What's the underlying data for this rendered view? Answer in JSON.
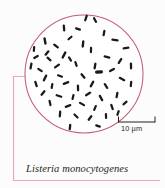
{
  "figure": {
    "title": "Listeria monocytogenes",
    "organism_label": "Listeria monocytogenes",
    "field_shape": "circle",
    "background_color": "#fdfcfc",
    "circle_stroke_color": "#c45b74",
    "bracket_color": "#e8a8b6",
    "cell_color": "#1a1a1a",
    "scale_bar": {
      "label": "10 µm",
      "value": 10,
      "unit": "µm"
    }
  },
  "chart_data": {
    "type": "scatter",
    "title": "Listeria monocytogenes",
    "xlabel": "",
    "ylabel": "",
    "annotations": [
      "10 µm"
    ],
    "field_circle": {
      "cx": 84,
      "cy": 74,
      "r": 59
    },
    "scale_bar_px": {
      "x1": 118,
      "x2": 155,
      "y": 122,
      "length_um": 10
    },
    "cell_count": 58,
    "cell_shape": "rod (bacillus)",
    "cells": [
      {
        "x": 86,
        "y": 18,
        "a": 108,
        "l": 7.0,
        "w": 2.3
      },
      {
        "x": 95,
        "y": 20,
        "a": 62,
        "l": 6.4,
        "w": 2.3
      },
      {
        "x": 64,
        "y": 28,
        "a": 85,
        "l": 7.2,
        "w": 2.3
      },
      {
        "x": 78,
        "y": 29,
        "a": 18,
        "l": 6.2,
        "w": 2.2
      },
      {
        "x": 45,
        "y": 41,
        "a": 80,
        "l": 7.6,
        "w": 2.4
      },
      {
        "x": 70,
        "y": 38,
        "a": 140,
        "l": 6.0,
        "w": 2.2
      },
      {
        "x": 104,
        "y": 33,
        "a": 100,
        "l": 6.6,
        "w": 2.3
      },
      {
        "x": 115,
        "y": 40,
        "a": 8,
        "l": 7.4,
        "w": 2.3
      },
      {
        "x": 34,
        "y": 49,
        "a": 95,
        "l": 6.0,
        "w": 2.2
      },
      {
        "x": 56,
        "y": 46,
        "a": 38,
        "l": 6.8,
        "w": 2.3
      },
      {
        "x": 83,
        "y": 44,
        "a": 96,
        "l": 7.4,
        "w": 2.4
      },
      {
        "x": 91,
        "y": 50,
        "a": 92,
        "l": 6.4,
        "w": 2.2
      },
      {
        "x": 126,
        "y": 48,
        "a": 170,
        "l": 7.0,
        "w": 2.3
      },
      {
        "x": 47,
        "y": 53,
        "a": 130,
        "l": 6.6,
        "w": 2.3
      },
      {
        "x": 49,
        "y": 59,
        "a": 42,
        "l": 6.2,
        "w": 2.2
      },
      {
        "x": 64,
        "y": 55,
        "a": 118,
        "l": 7.8,
        "w": 2.4
      },
      {
        "x": 70,
        "y": 59,
        "a": 58,
        "l": 6.0,
        "w": 2.2
      },
      {
        "x": 107,
        "y": 57,
        "a": 14,
        "l": 7.0,
        "w": 2.3
      },
      {
        "x": 120,
        "y": 61,
        "a": 122,
        "l": 6.8,
        "w": 2.3
      },
      {
        "x": 31,
        "y": 66,
        "a": 100,
        "l": 7.2,
        "w": 2.3
      },
      {
        "x": 40,
        "y": 70,
        "a": 35,
        "l": 6.4,
        "w": 2.2
      },
      {
        "x": 57,
        "y": 66,
        "a": 145,
        "l": 7.0,
        "w": 2.3
      },
      {
        "x": 76,
        "y": 64,
        "a": 72,
        "l": 6.2,
        "w": 2.2
      },
      {
        "x": 95,
        "y": 66,
        "a": 100,
        "l": 6.8,
        "w": 2.3
      },
      {
        "x": 112,
        "y": 70,
        "a": 150,
        "l": 6.6,
        "w": 2.3
      },
      {
        "x": 131,
        "y": 66,
        "a": 88,
        "l": 7.0,
        "w": 2.3
      },
      {
        "x": 99,
        "y": 72,
        "a": 176,
        "l": 8.0,
        "w": 3.2
      },
      {
        "x": 45,
        "y": 78,
        "a": 115,
        "l": 7.6,
        "w": 2.4
      },
      {
        "x": 60,
        "y": 76,
        "a": 20,
        "l": 6.4,
        "w": 2.2
      },
      {
        "x": 83,
        "y": 76,
        "a": 50,
        "l": 6.8,
        "w": 2.3
      },
      {
        "x": 122,
        "y": 79,
        "a": 28,
        "l": 7.2,
        "w": 2.3
      },
      {
        "x": 36,
        "y": 84,
        "a": 72,
        "l": 6.6,
        "w": 2.3
      },
      {
        "x": 52,
        "y": 86,
        "a": 100,
        "l": 6.2,
        "w": 2.2
      },
      {
        "x": 66,
        "y": 83,
        "a": 160,
        "l": 7.0,
        "w": 2.3
      },
      {
        "x": 78,
        "y": 88,
        "a": 88,
        "l": 6.8,
        "w": 2.3
      },
      {
        "x": 92,
        "y": 84,
        "a": 118,
        "l": 7.4,
        "w": 2.4
      },
      {
        "x": 106,
        "y": 86,
        "a": 56,
        "l": 6.6,
        "w": 2.3
      },
      {
        "x": 131,
        "y": 84,
        "a": 96,
        "l": 6.4,
        "w": 2.2
      },
      {
        "x": 43,
        "y": 93,
        "a": 130,
        "l": 6.8,
        "w": 2.3
      },
      {
        "x": 59,
        "y": 96,
        "a": 18,
        "l": 7.0,
        "w": 2.3
      },
      {
        "x": 73,
        "y": 97,
        "a": 104,
        "l": 6.2,
        "w": 2.2
      },
      {
        "x": 88,
        "y": 94,
        "a": 148,
        "l": 6.8,
        "w": 2.3
      },
      {
        "x": 101,
        "y": 98,
        "a": 62,
        "l": 7.2,
        "w": 2.3
      },
      {
        "x": 117,
        "y": 95,
        "a": 100,
        "l": 6.6,
        "w": 2.3
      },
      {
        "x": 50,
        "y": 103,
        "a": 78,
        "l": 6.4,
        "w": 2.2
      },
      {
        "x": 68,
        "y": 106,
        "a": 160,
        "l": 7.0,
        "w": 2.3
      },
      {
        "x": 82,
        "y": 104,
        "a": 30,
        "l": 6.8,
        "w": 2.3
      },
      {
        "x": 95,
        "y": 108,
        "a": 112,
        "l": 6.4,
        "w": 2.2
      },
      {
        "x": 112,
        "y": 107,
        "a": 70,
        "l": 6.6,
        "w": 2.3
      },
      {
        "x": 125,
        "y": 103,
        "a": 140,
        "l": 6.2,
        "w": 2.2
      },
      {
        "x": 60,
        "y": 114,
        "a": 94,
        "l": 6.8,
        "w": 2.3
      },
      {
        "x": 76,
        "y": 116,
        "a": 44,
        "l": 6.4,
        "w": 2.2
      },
      {
        "x": 90,
        "y": 118,
        "a": 128,
        "l": 6.6,
        "w": 2.3
      },
      {
        "x": 106,
        "y": 116,
        "a": 88,
        "l": 6.2,
        "w": 2.2
      },
      {
        "x": 118,
        "y": 113,
        "a": 110,
        "l": 6.0,
        "w": 2.2
      },
      {
        "x": 70,
        "y": 127,
        "a": 96,
        "l": 6.6,
        "w": 2.3
      },
      {
        "x": 98,
        "y": 126,
        "a": 20,
        "l": 6.0,
        "w": 2.2
      },
      {
        "x": 36,
        "y": 57,
        "a": 150,
        "l": 6.2,
        "w": 2.2
      }
    ]
  }
}
